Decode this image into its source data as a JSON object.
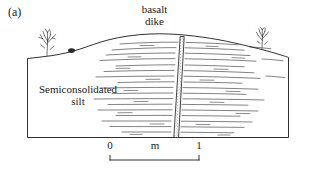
{
  "figure": {
    "panel_letter": "(a)",
    "background_color": "#ffffff",
    "line_color": "#1a1a1a",
    "dike_fill_color": "#8c8c8c"
  },
  "annotations": {
    "dike_title_line1": "basalt",
    "dike_title_line2": "dike",
    "unit_label_line1": "Semiconsolidated",
    "unit_label_line2": "silt"
  },
  "scale_bar": {
    "start_label": "0",
    "unit_label": "m",
    "end_label": "1"
  },
  "icons": {
    "tree_left": "tree-icon",
    "shrub_left": "shrub-icon",
    "tree_right": "tree-icon"
  }
}
